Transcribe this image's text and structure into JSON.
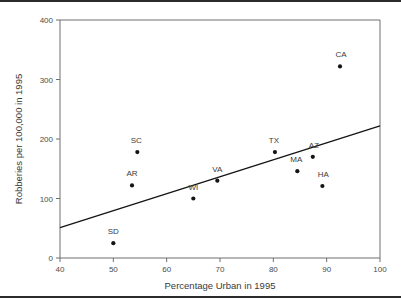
{
  "figure": {
    "background_color": "#ffffff",
    "rule_color": "#2b2b2b",
    "axis_color": "#6f6f6f",
    "point_color": "#141414",
    "line_color": "#141414",
    "text_color": "#3a3a3a"
  },
  "chart_data": {
    "type": "scatter",
    "title": "",
    "xlabel": "Percentage Urban in 1995",
    "ylabel": "Robberies per 100,000 in 1995",
    "xlim": [
      40,
      100
    ],
    "ylim": [
      0,
      400
    ],
    "xticks": [
      40,
      50,
      60,
      70,
      80,
      90,
      100
    ],
    "yticks": [
      0,
      100,
      200,
      300,
      400
    ],
    "xtick_labels": [
      "40",
      "50",
      "60",
      "70",
      "80",
      "90",
      "100"
    ],
    "ytick_labels": [
      "0",
      "100",
      "200",
      "300",
      "400"
    ],
    "grid": false,
    "legend": null,
    "points": [
      {
        "label": "SD",
        "x": 50.0,
        "y": 25,
        "label_dx": 0,
        "label_dy": -9
      },
      {
        "label": "AR",
        "x": 53.5,
        "y": 122,
        "label_dx": 0,
        "label_dy": -9
      },
      {
        "label": "SC",
        "x": 54.5,
        "y": 178,
        "label_dx": -1,
        "label_dy": -9
      },
      {
        "label": "WI",
        "x": 65.0,
        "y": 100,
        "label_dx": 0,
        "label_dy": -9
      },
      {
        "label": "VA",
        "x": 69.5,
        "y": 130,
        "label_dx": 0,
        "label_dy": -9
      },
      {
        "label": "TX",
        "x": 80.3,
        "y": 178,
        "label_dx": -1,
        "label_dy": -9
      },
      {
        "label": "MA",
        "x": 84.5,
        "y": 146,
        "label_dx": -1,
        "label_dy": -9
      },
      {
        "label": "AZ",
        "x": 87.4,
        "y": 170,
        "label_dx": 1,
        "label_dy": -9
      },
      {
        "label": "HA",
        "x": 89.2,
        "y": 121,
        "label_dx": 1,
        "label_dy": -9
      },
      {
        "label": "CA",
        "x": 92.5,
        "y": 322,
        "label_dx": 1,
        "label_dy": -9
      }
    ],
    "fit_line": {
      "type": "linear-regression",
      "x_start": 40,
      "y_start": 51,
      "x_end": 100,
      "y_end": 222
    }
  }
}
